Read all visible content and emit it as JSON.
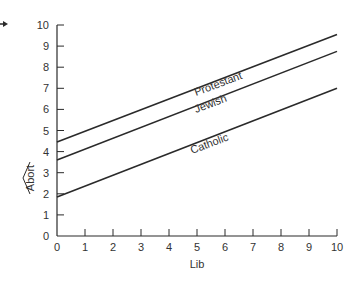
{
  "chart_data": {
    "type": "line",
    "title": "",
    "xlabel": "Lib",
    "ylabel": "Abort (predicted)",
    "ylabel_text": "Abort",
    "xlim": [
      0,
      10
    ],
    "ylim": [
      0,
      10
    ],
    "x_ticks": [
      0,
      1,
      2,
      3,
      4,
      5,
      6,
      7,
      8,
      9,
      10
    ],
    "y_ticks": [
      0,
      1,
      2,
      3,
      4,
      5,
      6,
      7,
      8,
      9,
      10
    ],
    "grid": false,
    "legend": "inline labels on lines",
    "x": [
      0,
      10
    ],
    "series": [
      {
        "name": "Protestant",
        "values": [
          4.45,
          9.55
        ]
      },
      {
        "name": "Jewish",
        "values": [
          3.6,
          8.75
        ]
      },
      {
        "name": "Catholic",
        "values": [
          1.85,
          7.0
        ]
      }
    ]
  },
  "labels": {
    "x_axis": "Lib",
    "y_axis": "Abort",
    "protestant": "Protestant",
    "jewish": "Jewish",
    "catholic": "Catholic"
  },
  "colors": {
    "line": "#2a2a2a",
    "background": "#ffffff"
  }
}
